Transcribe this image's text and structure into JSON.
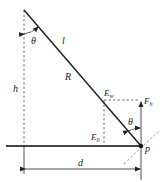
{
  "diagram": {
    "labels": {
      "theta_top": "θ",
      "l": "l",
      "R": "R",
      "h": "h",
      "E_upper": "E",
      "E_upper_sub": "w",
      "E_lower": "E",
      "E_lower_sub": "0",
      "F": "F",
      "F_sub": "h",
      "theta_right": "θ",
      "p": "p",
      "d": "d"
    },
    "colors": {
      "line": "#222222",
      "dashed": "#555555"
    }
  }
}
